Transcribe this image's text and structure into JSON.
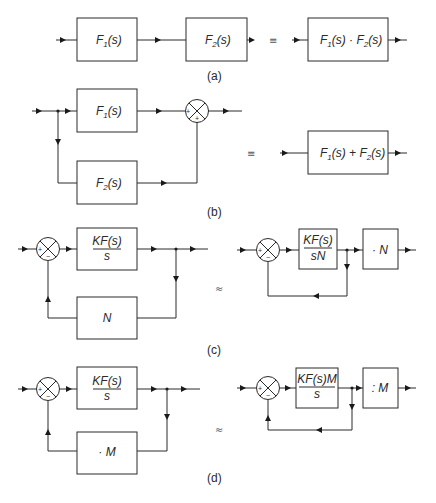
{
  "diagram": {
    "a": {
      "caption": "(a)",
      "blocks": [
        "F1(s)",
        "F2(s)",
        "F1(s) · F2(s)"
      ],
      "f1": {
        "F": "F",
        "sub": "1",
        "arg": "(s)"
      },
      "f2": {
        "F": "F",
        "sub": "2",
        "arg": "(s)"
      },
      "product": {
        "F1": "F",
        "sub1": "1",
        "arg1": "(s) · ",
        "F2": "F",
        "sub2": "2",
        "arg2": "(s)"
      },
      "relation": "≡"
    },
    "b": {
      "caption": "(b)",
      "blocks": [
        "F1(s)",
        "F2(s)",
        "F1(s) + F2(s)"
      ],
      "f1": {
        "F": "F",
        "sub": "1",
        "arg": "(s)"
      },
      "f2": {
        "F": "F",
        "sub": "2",
        "arg": "(s)"
      },
      "sum": {
        "F1": "F",
        "sub1": "1",
        "arg1": "(s) + ",
        "F2": "F",
        "sub2": "2",
        "arg2": "(s)"
      },
      "junction_signs": [
        "+",
        "+"
      ],
      "relation": "≡"
    },
    "c": {
      "caption": "(c)",
      "left": {
        "forward_num": "KF(s)",
        "forward_den": "s",
        "feedback": "N",
        "junction_signs": [
          "+",
          "−"
        ]
      },
      "right": {
        "forward_num": "KF(s)",
        "forward_den": "sN",
        "post": "· N",
        "junction_signs": [
          "+",
          "−"
        ]
      },
      "relation": "≈"
    },
    "d": {
      "caption": "(d)",
      "left": {
        "forward_num": "KF(s)",
        "forward_den": "s",
        "feedback": "· M",
        "junction_signs": [
          "+",
          "−"
        ]
      },
      "right": {
        "forward_num": "KF(s)M",
        "forward_den": "s",
        "post": ": M",
        "junction_signs": [
          "+",
          "−"
        ]
      },
      "relation": "≈"
    }
  }
}
